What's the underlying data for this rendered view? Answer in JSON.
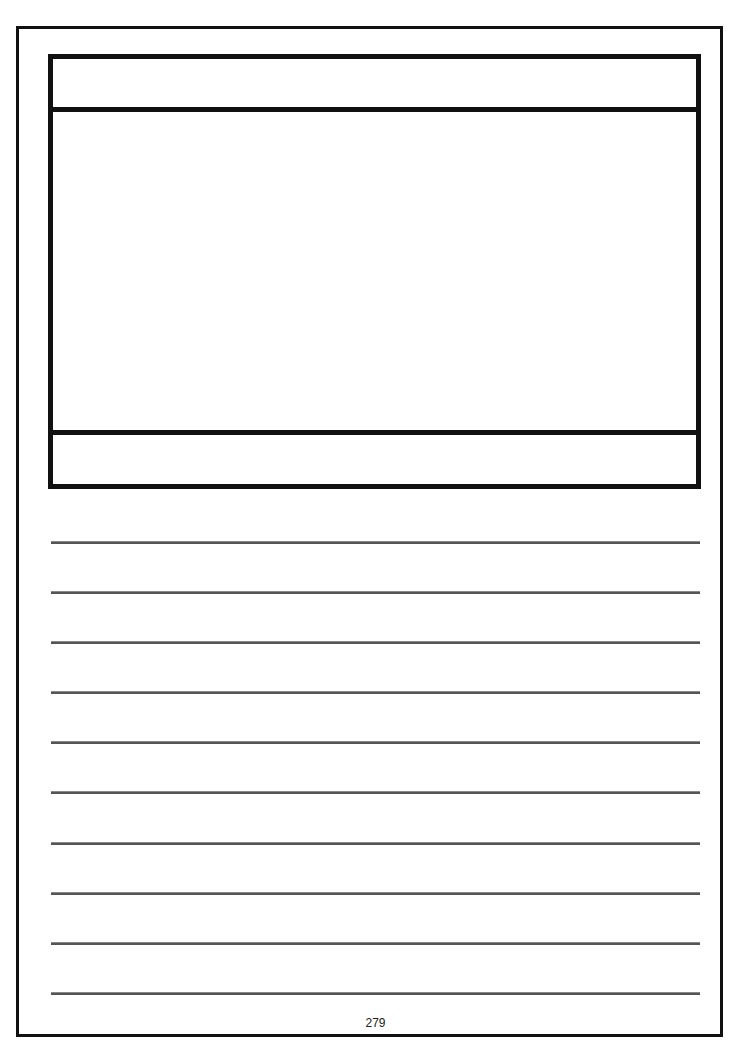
{
  "page": {
    "page_number": "279",
    "ruled_lines_count": 10,
    "line_color": "#555555",
    "border_color": "#111111"
  },
  "picture_box": {
    "title_text": "",
    "body_text": "",
    "caption_text": ""
  },
  "writing_lines": [
    "",
    "",
    "",
    "",
    "",
    "",
    "",
    "",
    "",
    ""
  ]
}
